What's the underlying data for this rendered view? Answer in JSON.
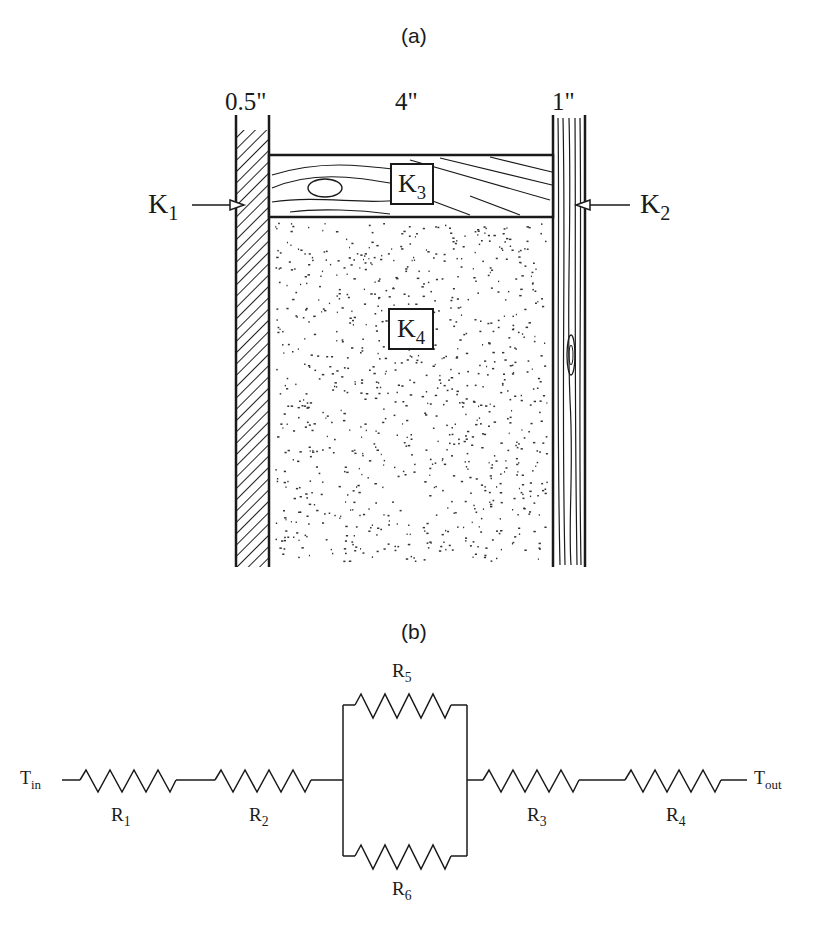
{
  "panel_a": {
    "caption": "(a)",
    "dimensions": {
      "left": "0.5\"",
      "middle": "4\"",
      "right": "1\""
    },
    "labels": {
      "k1": {
        "base": "K",
        "sub": "1"
      },
      "k2": {
        "base": "K",
        "sub": "2"
      },
      "k3": {
        "base": "K",
        "sub": "3"
      },
      "k4": {
        "base": "K",
        "sub": "4"
      }
    }
  },
  "panel_b": {
    "caption": "(b)",
    "t_in": {
      "base": "T",
      "sub": "in"
    },
    "t_out": {
      "base": "T",
      "sub": "out"
    },
    "resistors": {
      "r1": {
        "base": "R",
        "sub": "1"
      },
      "r2": {
        "base": "R",
        "sub": "2"
      },
      "r3": {
        "base": "R",
        "sub": "3"
      },
      "r4": {
        "base": "R",
        "sub": "4"
      },
      "r5": {
        "base": "R",
        "sub": "5"
      },
      "r6": {
        "base": "R",
        "sub": "6"
      }
    }
  }
}
